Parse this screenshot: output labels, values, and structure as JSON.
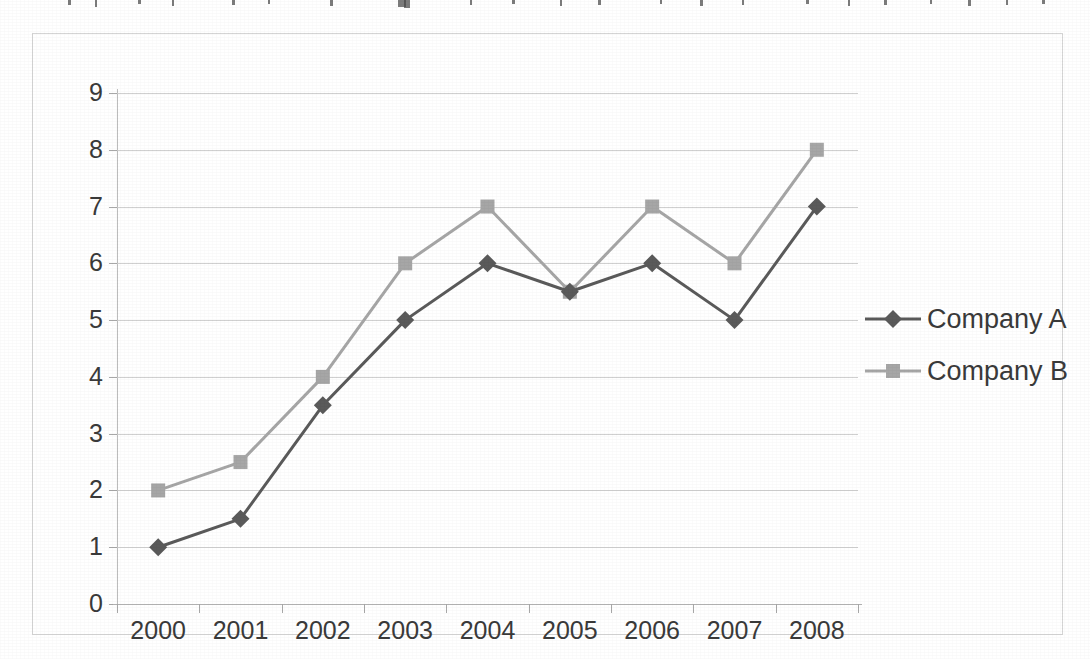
{
  "chart_data": {
    "type": "line",
    "title": "",
    "xlabel": "",
    "ylabel": "",
    "categories": [
      "2000",
      "2001",
      "2002",
      "2003",
      "2004",
      "2005",
      "2006",
      "2007",
      "2008"
    ],
    "series": [
      {
        "name": "Company A",
        "color": "#5a5a5a",
        "marker": "diamond",
        "values": [
          1,
          1.5,
          3.5,
          5,
          6,
          5.5,
          6,
          5,
          7
        ]
      },
      {
        "name": "Company B",
        "color": "#a6a6a6",
        "marker": "square",
        "values": [
          2,
          2.5,
          4,
          6,
          7,
          5.5,
          7,
          6,
          8
        ]
      }
    ],
    "ylim": [
      0,
      9
    ],
    "ytick_labels": [
      "0",
      "1",
      "2",
      "3",
      "4",
      "5",
      "6",
      "7",
      "8",
      "9"
    ],
    "ytick_values": [
      0,
      1,
      2,
      3,
      4,
      5,
      6,
      7,
      8,
      9
    ],
    "grid": "horizontal",
    "legend_position": "right",
    "grid_color": "#c8c8c8",
    "axis_color": "#b4b4b4",
    "frame_color": "#d5d5d5",
    "text_color": "#3a3a3a",
    "background": "#ffffff"
  }
}
